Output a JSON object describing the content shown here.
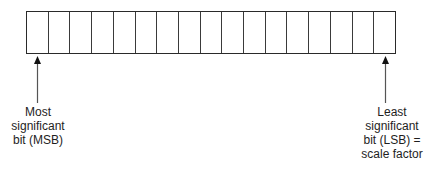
{
  "diagram": {
    "register": {
      "bit_count": 17,
      "cells": [
        "",
        "",
        "",
        "",
        "",
        "",
        "",
        "",
        "",
        "",
        "",
        "",
        "",
        "",
        "",
        "",
        ""
      ]
    },
    "msb_label": {
      "lines": [
        "Most",
        "significant",
        "bit (MSB)"
      ]
    },
    "lsb_label": {
      "lines": [
        "Least",
        "significant",
        "bit (LSB) =",
        "scale factor"
      ]
    },
    "colors": {
      "line": "#2a2a2a",
      "arrow": "#555555",
      "text": "#1e1e1e"
    }
  }
}
